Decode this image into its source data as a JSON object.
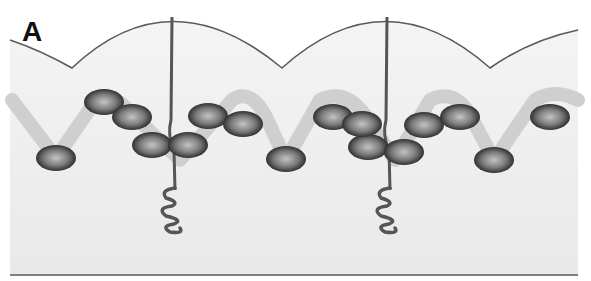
{
  "figure": {
    "panel_label": "A",
    "colors": {
      "background": "#ffffff",
      "fill": "#f1f1f1",
      "outline": "#5a5a5a",
      "strand": "#cfcfcf",
      "bead_dark": "#2a2a2a",
      "bead_light": "#b8b8b8",
      "stalk": "#555555"
    },
    "arcs": [
      {
        "x_start": 10,
        "x_end": 72
      },
      {
        "x_start": 72,
        "x_end": 282
      },
      {
        "x_start": 282,
        "x_end": 490
      },
      {
        "x_start": 490,
        "x_end": 578
      }
    ],
    "beads": [
      {
        "cx": 56,
        "cy": 158
      },
      {
        "cx": 104,
        "cy": 102
      },
      {
        "cx": 132,
        "cy": 117
      },
      {
        "cx": 152,
        "cy": 145
      },
      {
        "cx": 188,
        "cy": 145
      },
      {
        "cx": 208,
        "cy": 116
      },
      {
        "cx": 243,
        "cy": 124
      },
      {
        "cx": 286,
        "cy": 159
      },
      {
        "cx": 333,
        "cy": 117
      },
      {
        "cx": 362,
        "cy": 124
      },
      {
        "cx": 368,
        "cy": 147
      },
      {
        "cx": 404,
        "cy": 152
      },
      {
        "cx": 424,
        "cy": 125
      },
      {
        "cx": 460,
        "cy": 117
      },
      {
        "cx": 494,
        "cy": 160
      },
      {
        "cx": 550,
        "cy": 117
      }
    ],
    "stalks": [
      {
        "x": 172,
        "top": 17,
        "coil_top": 185
      },
      {
        "x": 387,
        "top": 17,
        "coil_top": 185
      }
    ]
  }
}
